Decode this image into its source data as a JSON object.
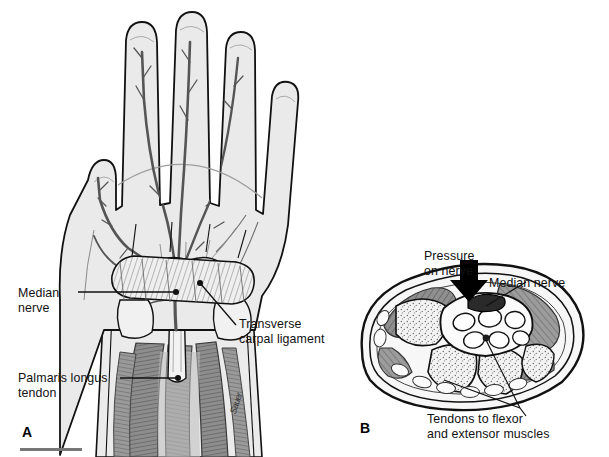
{
  "figure": {
    "background_color": "#ffffff",
    "ink_color": "#111111",
    "skin_fill": "#e9e9e9",
    "nerve_color": "#5a5a5a",
    "muscle_color": "#8a8a8a",
    "bone_fill": "#f4f4f4",
    "signature": "Sauer"
  },
  "panel_a": {
    "letter": "A",
    "caption_view": "Palmar view of hand and wrist",
    "labels": [
      {
        "id": "median-nerve",
        "text": "Median\nnerve",
        "x": 18,
        "y": 286
      },
      {
        "id": "transverse-carpal-ligament",
        "text": "Transverse\ncarpal ligament",
        "x": 239,
        "y": 317
      },
      {
        "id": "palmaris-longus-tendon",
        "text": "Palmaris longus\ntendon",
        "x": 18,
        "y": 371
      }
    ]
  },
  "panel_b": {
    "letter": "B",
    "caption_view": "Cross section through the wrist",
    "labels": [
      {
        "id": "pressure-on-nerve",
        "text": "Pressure\non nerve",
        "x": 424,
        "y": 249
      },
      {
        "id": "median-nerve-b",
        "text": "Median nerve",
        "x": 489,
        "y": 276
      },
      {
        "id": "tendons-flexor-extensor",
        "text": "Tendons to flexor\nand extensor muscles",
        "x": 427,
        "y": 412
      }
    ]
  }
}
